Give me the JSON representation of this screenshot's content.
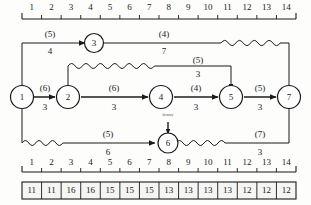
{
  "diagram": {
    "top_ruler": {
      "name": "top-time-scale",
      "ticks": [
        "1",
        "2",
        "3",
        "4",
        "5",
        "6",
        "7",
        "8",
        "9",
        "10",
        "11",
        "12",
        "13",
        "14"
      ]
    },
    "bottom_ruler": {
      "name": "bottom-time-scale",
      "ticks": [
        "1",
        "2",
        "3",
        "4",
        "5",
        "6",
        "7",
        "8",
        "9",
        "10",
        "11",
        "12",
        "13",
        "14"
      ]
    },
    "resource_row": {
      "name": "resource-histogram-row",
      "values": [
        "11",
        "11",
        "16",
        "16",
        "15",
        "15",
        "15",
        "13",
        "13",
        "13",
        "13",
        "12",
        "12",
        "12"
      ]
    },
    "nodes": [
      {
        "id": "1",
        "label": "1"
      },
      {
        "id": "2",
        "label": "2"
      },
      {
        "id": "3",
        "label": "3"
      },
      {
        "id": "4",
        "label": "4"
      },
      {
        "id": "5",
        "label": "5"
      },
      {
        "id": "6",
        "label": "6"
      },
      {
        "id": "7",
        "label": "7"
      }
    ],
    "edges": [
      {
        "from": "1",
        "to": "3",
        "top": "(5)",
        "bottom": "4"
      },
      {
        "from": "3",
        "to": "7",
        "top": "(4)",
        "bottom": "7"
      },
      {
        "from": "1",
        "to": "2",
        "top": "(6)",
        "bottom": "3"
      },
      {
        "from": "2",
        "to": "4",
        "top": "(6)",
        "bottom": "3"
      },
      {
        "from": "4",
        "to": "5",
        "top": "(4)",
        "bottom": "3"
      },
      {
        "from": "5",
        "to": "7",
        "top": "(5)",
        "bottom": "3"
      },
      {
        "from": "2",
        "to": "5",
        "top": "(5)",
        "bottom": "3"
      },
      {
        "from": "1",
        "to": "6",
        "top": "(5)",
        "bottom": "6"
      },
      {
        "from": "6",
        "to": "7",
        "top": "(7)",
        "bottom": "3"
      }
    ],
    "dummy": {
      "label": "dummy"
    },
    "colors": {
      "ink": "#1a1a1a",
      "critical": "#555555",
      "background": "#fdfdfb"
    }
  }
}
